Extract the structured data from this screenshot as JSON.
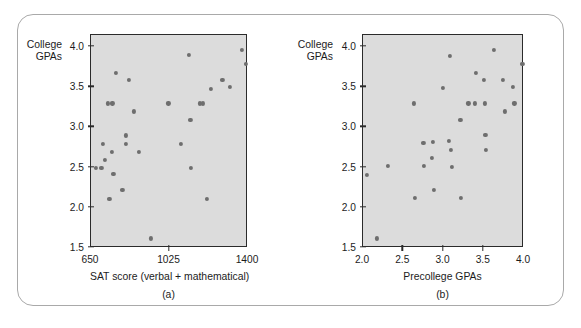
{
  "figure": {
    "frame_color": "#a9a9a9",
    "plot_background": "#dcdcdc",
    "point_color": "#6e6e6e",
    "axis_color": "#2b2b2b"
  },
  "chart_data": [
    {
      "type": "scatter",
      "panel": "(a)",
      "title": "",
      "xlabel": "SAT score (verbal + mathematical)",
      "ylabel": "College GPAs",
      "ylabel_line1": "College",
      "ylabel_line2": "GPAs",
      "xlim": [
        650,
        1400
      ],
      "ylim": [
        1.5,
        4.15
      ],
      "xticks": [
        650,
        1025,
        1400
      ],
      "xticklabels": [
        "650",
        "1025",
        "1400"
      ],
      "yticks": [
        1.5,
        2.0,
        2.5,
        3.0,
        3.5,
        4.0
      ],
      "yticklabels": [
        "1.5",
        "2.0",
        "2.5",
        "3.0",
        "3.5",
        "4.0"
      ],
      "grid": false,
      "legend": "none",
      "points": [
        {
          "x": 672,
          "y": 2.5
        },
        {
          "x": 700,
          "y": 2.5
        },
        {
          "x": 705,
          "y": 2.8
        },
        {
          "x": 715,
          "y": 2.6
        },
        {
          "x": 730,
          "y": 3.3
        },
        {
          "x": 752,
          "y": 3.3
        },
        {
          "x": 738,
          "y": 2.11
        },
        {
          "x": 748,
          "y": 2.7
        },
        {
          "x": 757,
          "y": 2.42
        },
        {
          "x": 770,
          "y": 3.68
        },
        {
          "x": 800,
          "y": 2.22
        },
        {
          "x": 815,
          "y": 2.9
        },
        {
          "x": 818,
          "y": 2.8
        },
        {
          "x": 830,
          "y": 3.59
        },
        {
          "x": 855,
          "y": 3.2
        },
        {
          "x": 880,
          "y": 2.7
        },
        {
          "x": 935,
          "y": 1.62
        },
        {
          "x": 1020,
          "y": 3.3
        },
        {
          "x": 1080,
          "y": 2.8
        },
        {
          "x": 1118,
          "y": 3.9
        },
        {
          "x": 1125,
          "y": 3.09
        },
        {
          "x": 1128,
          "y": 2.5
        },
        {
          "x": 1172,
          "y": 3.3
        },
        {
          "x": 1185,
          "y": 3.3
        },
        {
          "x": 1202,
          "y": 2.11
        },
        {
          "x": 1222,
          "y": 3.48
        },
        {
          "x": 1278,
          "y": 3.59
        },
        {
          "x": 1312,
          "y": 3.5
        },
        {
          "x": 1372,
          "y": 3.96
        },
        {
          "x": 1390,
          "y": 3.79
        }
      ]
    },
    {
      "type": "scatter",
      "panel": "(b)",
      "title": "",
      "xlabel": "Precollege GPAs",
      "ylabel": "College GPAs",
      "ylabel_line1": "College",
      "ylabel_line2": "GPAs",
      "xlim": [
        2.0,
        4.0
      ],
      "ylim": [
        1.5,
        4.15
      ],
      "xticks": [
        2.0,
        2.5,
        3.0,
        3.5,
        4.0
      ],
      "xticklabels": [
        "2.0",
        "2.5",
        "3.0",
        "3.5",
        "4.0"
      ],
      "yticks": [
        1.5,
        2.0,
        2.5,
        3.0,
        3.5,
        4.0
      ],
      "yticklabels": [
        "1.5",
        "2.0",
        "2.5",
        "3.0",
        "3.5",
        "4.0"
      ],
      "grid": false,
      "legend": "none",
      "points": [
        {
          "x": 2.05,
          "y": 2.41
        },
        {
          "x": 2.17,
          "y": 1.62
        },
        {
          "x": 2.31,
          "y": 2.52
        },
        {
          "x": 2.63,
          "y": 3.3
        },
        {
          "x": 2.64,
          "y": 2.12
        },
        {
          "x": 2.75,
          "y": 2.81
        },
        {
          "x": 2.76,
          "y": 2.52
        },
        {
          "x": 2.86,
          "y": 2.62
        },
        {
          "x": 2.87,
          "y": 2.82
        },
        {
          "x": 2.88,
          "y": 2.22
        },
        {
          "x": 2.99,
          "y": 3.49
        },
        {
          "x": 3.07,
          "y": 2.83
        },
        {
          "x": 3.08,
          "y": 3.89
        },
        {
          "x": 3.09,
          "y": 2.72
        },
        {
          "x": 3.1,
          "y": 2.51
        },
        {
          "x": 3.21,
          "y": 3.09
        },
        {
          "x": 3.22,
          "y": 2.12
        },
        {
          "x": 3.31,
          "y": 3.3
        },
        {
          "x": 3.39,
          "y": 3.3
        },
        {
          "x": 3.4,
          "y": 3.68
        },
        {
          "x": 3.5,
          "y": 3.59
        },
        {
          "x": 3.51,
          "y": 3.3
        },
        {
          "x": 3.52,
          "y": 2.91
        },
        {
          "x": 3.53,
          "y": 2.72
        },
        {
          "x": 3.63,
          "y": 3.96
        },
        {
          "x": 3.74,
          "y": 3.59
        },
        {
          "x": 3.76,
          "y": 3.2
        },
        {
          "x": 3.86,
          "y": 3.5
        },
        {
          "x": 3.88,
          "y": 3.3
        },
        {
          "x": 3.98,
          "y": 3.79
        }
      ]
    }
  ]
}
